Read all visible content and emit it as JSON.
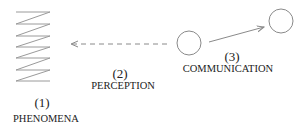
{
  "diagram": {
    "nodes": [
      {
        "id": "phenomena",
        "number": "(1)",
        "label": "PHENOMENA",
        "shape": "zigzag"
      },
      {
        "id": "perception",
        "number": "(2)",
        "label": "PERCEPTION",
        "shape": "dashed-arrow"
      },
      {
        "id": "communication",
        "number": "(3)",
        "label": "COMMUNICATION",
        "shape": "circle-arrow-circle"
      }
    ],
    "colors": {
      "stroke": "#8a8a8a",
      "text": "#222222"
    }
  }
}
